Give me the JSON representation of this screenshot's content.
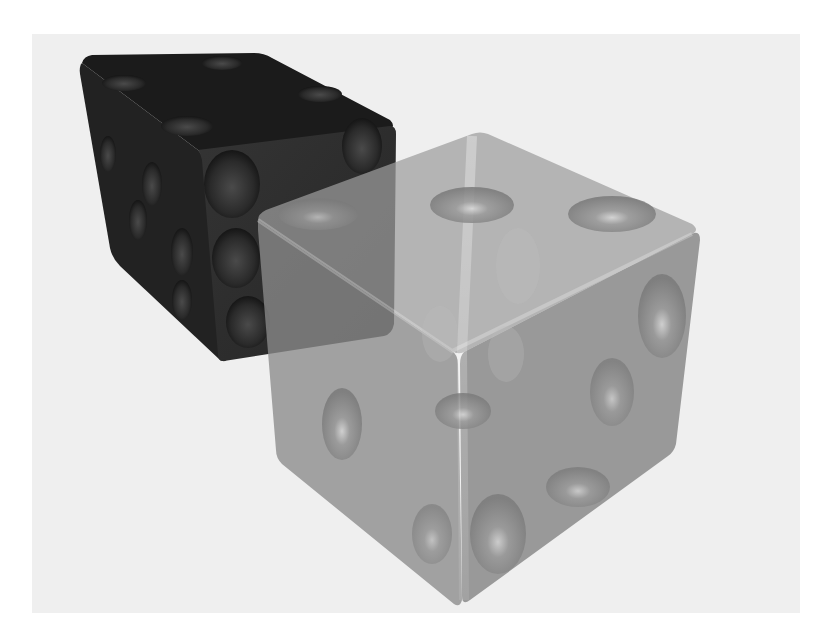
{
  "image": {
    "description": "3D render of two dice: an opaque black die behind a translucent gray die",
    "caption": "",
    "colors": {
      "page_background": "#ffffff",
      "render_background": "#efefef",
      "black_die_top": "#1c1c1c",
      "black_die_left": "#232323",
      "black_die_right": "#2e2e2e",
      "glass_die_top": "#9c9c9c",
      "glass_die_left": "#8e8e8e",
      "glass_die_right": "#858585"
    }
  },
  "objects": [
    {
      "name": "black-die",
      "material": "opaque black",
      "visible_faces": [
        "top",
        "left",
        "right"
      ]
    },
    {
      "name": "translucent-die",
      "material": "translucent gray glass",
      "visible_faces": [
        "top",
        "left",
        "right"
      ]
    }
  ]
}
